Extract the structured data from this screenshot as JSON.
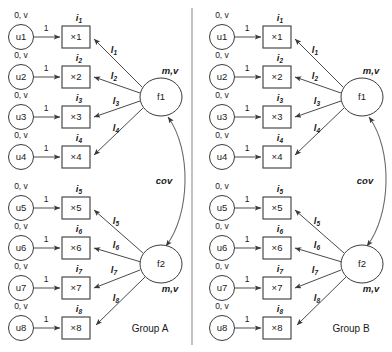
{
  "diagram": {
    "background_color": "#ffffff",
    "stroke_color": "#4a4a4a",
    "text_color": "#1a1a1a",
    "divider_color": "#9a9a9a"
  },
  "labels": {
    "residual_param": "0, v",
    "fixed_loading": "1",
    "factor_param": "m,v",
    "covariance": "cov",
    "loading_letter": "l",
    "intercept_letter": "i",
    "indicator_prefix": "×"
  },
  "groups": [
    {
      "id": "group-a",
      "name": "Group A",
      "factors": [
        {
          "id": "f1",
          "label": "f1",
          "param": "m,v",
          "indicators": [
            {
              "residual": "u1",
              "residual_param": "0, v",
              "fixed": "1",
              "box": "×1",
              "intercept": "i",
              "intercept_sub": "1",
              "loading": "l",
              "loading_sub": "1"
            },
            {
              "residual": "u2",
              "residual_param": "0, v",
              "fixed": "1",
              "box": "×2",
              "intercept": "i",
              "intercept_sub": "2",
              "loading": "l",
              "loading_sub": "2"
            },
            {
              "residual": "u3",
              "residual_param": "0, v",
              "fixed": "1",
              "box": "×3",
              "intercept": "i",
              "intercept_sub": "3",
              "loading": "l",
              "loading_sub": "3"
            },
            {
              "residual": "u4",
              "residual_param": "0, v",
              "fixed": "1",
              "box": "×4",
              "intercept": "i",
              "intercept_sub": "4",
              "loading": "l",
              "loading_sub": "4"
            }
          ]
        },
        {
          "id": "f2",
          "label": "f2",
          "param": "m,v",
          "indicators": [
            {
              "residual": "u5",
              "residual_param": "0, v",
              "fixed": "1",
              "box": "×5",
              "intercept": "i",
              "intercept_sub": "5",
              "loading": "l",
              "loading_sub": "5"
            },
            {
              "residual": "u6",
              "residual_param": "0, v",
              "fixed": "1",
              "box": "×6",
              "intercept": "i",
              "intercept_sub": "6",
              "loading": "l",
              "loading_sub": "6"
            },
            {
              "residual": "u7",
              "residual_param": "0, v",
              "fixed": "1",
              "box": "×7",
              "intercept": "i",
              "intercept_sub": "7",
              "loading": "l",
              "loading_sub": "7"
            },
            {
              "residual": "u8",
              "residual_param": "0, v",
              "fixed": "1",
              "box": "×8",
              "intercept": "i",
              "intercept_sub": "8",
              "loading": "l",
              "loading_sub": "8"
            }
          ]
        }
      ],
      "covariance_label": "cov"
    },
    {
      "id": "group-b",
      "name": "Group B",
      "factors": [
        {
          "id": "f1",
          "label": "f1",
          "param": "m,v",
          "indicators": [
            {
              "residual": "u1",
              "residual_param": "0, v",
              "fixed": "1",
              "box": "×1",
              "intercept": "i",
              "intercept_sub": "1",
              "loading": "l",
              "loading_sub": "1"
            },
            {
              "residual": "u2",
              "residual_param": "0, v",
              "fixed": "1",
              "box": "×2",
              "intercept": "i",
              "intercept_sub": "2",
              "loading": "l",
              "loading_sub": "2"
            },
            {
              "residual": "u3",
              "residual_param": "0, v",
              "fixed": "1",
              "box": "×3",
              "intercept": "i",
              "intercept_sub": "3",
              "loading": "l",
              "loading_sub": "3"
            },
            {
              "residual": "u4",
              "residual_param": "0, v",
              "fixed": "1",
              "box": "×4",
              "intercept": "i",
              "intercept_sub": "4",
              "loading": "l",
              "loading_sub": "4"
            }
          ]
        },
        {
          "id": "f2",
          "label": "f2",
          "param": "m,v",
          "indicators": [
            {
              "residual": "u5",
              "residual_param": "0, v",
              "fixed": "1",
              "box": "×5",
              "intercept": "i",
              "intercept_sub": "5",
              "loading": "l",
              "loading_sub": "5"
            },
            {
              "residual": "u6",
              "residual_param": "0, v",
              "fixed": "1",
              "box": "×6",
              "intercept": "i",
              "intercept_sub": "6",
              "loading": "l",
              "loading_sub": "6"
            },
            {
              "residual": "u7",
              "residual_param": "0, v",
              "fixed": "1",
              "box": "×7",
              "intercept": "i",
              "intercept_sub": "7",
              "loading": "l",
              "loading_sub": "7"
            },
            {
              "residual": "u8",
              "residual_param": "0, v",
              "fixed": "1",
              "box": "×8",
              "intercept": "i",
              "intercept_sub": "8",
              "loading": "l",
              "loading_sub": "8"
            }
          ]
        }
      ],
      "covariance_label": "cov"
    }
  ]
}
